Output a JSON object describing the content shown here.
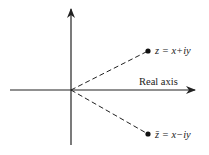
{
  "diagram": {
    "type": "complex-plane",
    "axes": {
      "horizontal_label": "Real axis",
      "vertical_label": ""
    },
    "points": [
      {
        "name": "z",
        "label": "z = x+iy"
      },
      {
        "name": "z-conjugate",
        "label": "z̄ = x−iy"
      }
    ],
    "colors": {
      "ink": "#222222",
      "background": "#ffffff"
    }
  }
}
